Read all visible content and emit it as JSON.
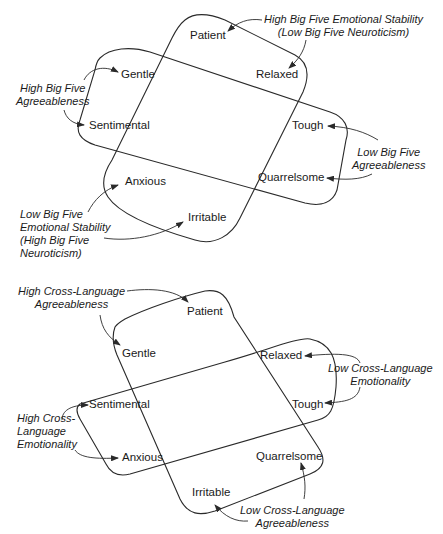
{
  "diagrams": {
    "big_five": {
      "traits": {
        "patient": "Patient",
        "relaxed": "Relaxed",
        "gentle": "Gentle",
        "sentimental": "Sentimental",
        "tough": "Tough",
        "quarrelsome": "Quarrelsome",
        "anxious": "Anxious",
        "irritable": "Irritable"
      },
      "factors": {
        "high_emotional_stability": [
          "High Big Five Emotional Stability",
          "(Low Big Five Neuroticism)"
        ],
        "high_agreeableness": [
          "High Big Five",
          "Agreeableness"
        ],
        "low_agreeableness": [
          "Low Big Five",
          "Agreeableness"
        ],
        "low_emotional_stability": [
          "Low Big Five",
          "Emotional Stability",
          "(High Big Five",
          "Neuroticism)"
        ]
      }
    },
    "cross_language": {
      "traits": {
        "patient": "Patient",
        "gentle": "Gentle",
        "relaxed": "Relaxed",
        "sentimental": "Sentimental",
        "tough": "Tough",
        "anxious": "Anxious",
        "quarrelsome": "Quarrelsome",
        "irritable": "Irritable"
      },
      "factors": {
        "high_agreeableness": [
          "High Cross-Language",
          "Agreeableness"
        ],
        "low_emotionality": [
          "Low Cross-Language",
          "Emotionality"
        ],
        "high_emotionality": [
          "High Cross-",
          "Language",
          "Emotionality"
        ],
        "low_agreeableness": [
          "Low Cross-Language",
          "Agreeableness"
        ]
      }
    }
  },
  "colors": {
    "line": "#2a2a2a",
    "text": "#1a1a1a",
    "background": "#ffffff"
  }
}
